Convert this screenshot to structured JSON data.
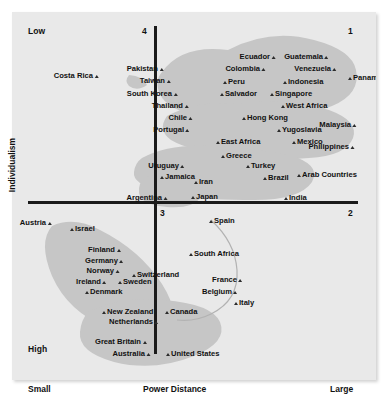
{
  "chart_data": {
    "type": "scatter",
    "title": "",
    "xlabel": "Power Distance",
    "ylabel": "Individualism",
    "x_low_label": "Small",
    "x_high_label": "Large",
    "y_low_label": "Low",
    "y_high_label": "High",
    "quadrant_labels": [
      "1",
      "2",
      "3",
      "4"
    ],
    "axis_note": "Vertical axis Individualism runs Low (top) to High (bottom); horizontal axis Power Distance runs Small (left) to Large (right).",
    "grid": false,
    "legend": "none",
    "points": [
      {
        "label": "Costa Rica",
        "side": "right",
        "x": 88,
        "y": 64
      },
      {
        "label": "Pakistan",
        "side": "right",
        "x": 153,
        "y": 57
      },
      {
        "label": "Taiwan",
        "side": "right",
        "x": 160,
        "y": 69
      },
      {
        "label": "South Korea",
        "side": "right",
        "x": 167,
        "y": 82
      },
      {
        "label": "Thailand",
        "side": "right",
        "x": 178,
        "y": 94
      },
      {
        "label": "Chile",
        "side": "right",
        "x": 182,
        "y": 106
      },
      {
        "label": "Portugal",
        "side": "right",
        "x": 179,
        "y": 118
      },
      {
        "label": "Peru",
        "side": "left",
        "x": 209,
        "y": 70
      },
      {
        "label": "Salvador",
        "side": "left",
        "x": 206,
        "y": 82
      },
      {
        "label": "Ecuador",
        "side": "right",
        "x": 265,
        "y": 45
      },
      {
        "label": "Colombia",
        "side": "right",
        "x": 255,
        "y": 57
      },
      {
        "label": "Guatemala",
        "side": "right",
        "x": 318,
        "y": 45
      },
      {
        "label": "Venezuela",
        "side": "right",
        "x": 326,
        "y": 57
      },
      {
        "label": "Panama",
        "side": "left",
        "x": 334,
        "y": 66
      },
      {
        "label": "Indonesia",
        "side": "left",
        "x": 269,
        "y": 70
      },
      {
        "label": "Singapore",
        "side": "left",
        "x": 256,
        "y": 82
      },
      {
        "label": "West Africa",
        "side": "left",
        "x": 267,
        "y": 94
      },
      {
        "label": "Hong Kong",
        "side": "left",
        "x": 228,
        "y": 106
      },
      {
        "label": "Yugoslavia",
        "side": "left",
        "x": 263,
        "y": 118
      },
      {
        "label": "Malaysia",
        "side": "right",
        "x": 346,
        "y": 113
      },
      {
        "label": "East Africa",
        "side": "left",
        "x": 202,
        "y": 130
      },
      {
        "label": "Mexico",
        "side": "left",
        "x": 278,
        "y": 130
      },
      {
        "label": "Philippines",
        "side": "right",
        "x": 344,
        "y": 135
      },
      {
        "label": "Greece",
        "side": "left",
        "x": 207,
        "y": 144
      },
      {
        "label": "Uruguay",
        "side": "right",
        "x": 174,
        "y": 154
      },
      {
        "label": "Turkey",
        "side": "left",
        "x": 232,
        "y": 154
      },
      {
        "label": "Jamaica",
        "side": "left",
        "x": 146,
        "y": 165
      },
      {
        "label": "Iran",
        "side": "left",
        "x": 180,
        "y": 170
      },
      {
        "label": "Brazil",
        "side": "left",
        "x": 249,
        "y": 166
      },
      {
        "label": "Arab Countries",
        "side": "left",
        "x": 283,
        "y": 163
      },
      {
        "label": "Argentina",
        "side": "right",
        "x": 157,
        "y": 186
      },
      {
        "label": "Japan",
        "side": "left",
        "x": 177,
        "y": 185
      },
      {
        "label": "India",
        "side": "left",
        "x": 270,
        "y": 186
      },
      {
        "label": "Spain",
        "side": "left",
        "x": 195,
        "y": 209
      },
      {
        "label": "Austria",
        "side": "right",
        "x": 41,
        "y": 211
      },
      {
        "label": "Israel",
        "side": "left",
        "x": 56,
        "y": 217
      },
      {
        "label": "Finland",
        "side": "right",
        "x": 110,
        "y": 238
      },
      {
        "label": "Germany",
        "side": "right",
        "x": 113,
        "y": 249
      },
      {
        "label": "Norway",
        "side": "right",
        "x": 109,
        "y": 259
      },
      {
        "label": "Switzerland",
        "side": "left",
        "x": 118,
        "y": 263
      },
      {
        "label": "Ireland",
        "side": "right",
        "x": 96,
        "y": 270
      },
      {
        "label": "Sweden",
        "side": "left",
        "x": 104,
        "y": 270
      },
      {
        "label": "Denmark",
        "side": "left",
        "x": 71,
        "y": 280
      },
      {
        "label": "South Africa",
        "side": "left",
        "x": 175,
        "y": 242
      },
      {
        "label": "France",
        "side": "right",
        "x": 232,
        "y": 268
      },
      {
        "label": "Belgium",
        "side": "right",
        "x": 227,
        "y": 280
      },
      {
        "label": "Italy",
        "side": "left",
        "x": 220,
        "y": 291
      },
      {
        "label": "New Zealand",
        "side": "left",
        "x": 88,
        "y": 300
      },
      {
        "label": "Canada",
        "side": "left",
        "x": 151,
        "y": 300
      },
      {
        "label": "Netherlands",
        "side": "right",
        "x": 148,
        "y": 310
      },
      {
        "label": "Great Britain",
        "side": "right",
        "x": 136,
        "y": 330
      },
      {
        "label": "Australia",
        "side": "right",
        "x": 140,
        "y": 342
      },
      {
        "label": "United States",
        "side": "left",
        "x": 152,
        "y": 342
      }
    ]
  },
  "labels": {
    "y_low": "Low",
    "y_high": "High",
    "x_small": "Small",
    "x_large": "Large",
    "x_axis_title": "Power Distance",
    "y_axis_title": "Individualism",
    "quad_1": "1",
    "quad_2": "2",
    "quad_3": "3",
    "quad_4": "4"
  },
  "colors": {
    "plot_background": "#e9e9e9",
    "cluster_fill": "#c6c6c6",
    "axis": "#1a1a1a",
    "text": "#111111"
  }
}
